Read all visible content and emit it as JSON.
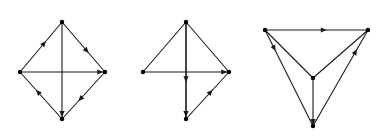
{
  "figure": {
    "type": "diagram",
    "edge_color": "#1a1a1a",
    "vertex_color": "#000000",
    "background": "#ffffff"
  },
  "operators": [
    {
      "id": "op1",
      "symbol": "=",
      "x": 117,
      "y": 73
    },
    {
      "id": "op2",
      "symbol": "=",
      "x": 241,
      "y": 73
    }
  ],
  "diagrams": [
    {
      "id": "diagram-1",
      "shape": "diamond",
      "vertices": [
        {
          "id": "top",
          "cx": 62,
          "cy": 22,
          "sign": "+",
          "sign_x": 62,
          "sign_y": 13
        },
        {
          "id": "left",
          "cx": 20,
          "cy": 72,
          "sign": "+",
          "sign_x": 9,
          "sign_y": 76
        },
        {
          "id": "right",
          "cx": 105,
          "cy": 72,
          "sign": "+",
          "sign_x": 110,
          "sign_y": 79
        },
        {
          "id": "bottom",
          "cx": 62,
          "cy": 119,
          "sign": "+",
          "sign_x": 62,
          "sign_y": 134
        }
      ],
      "edges": [
        {
          "id": "d",
          "label": "d",
          "from": "left",
          "to": "top",
          "label_x": 32,
          "label_y": 43,
          "arrow": "toward-to",
          "arrow_t": 0.62
        },
        {
          "id": "b",
          "label": "b",
          "from": "top",
          "to": "right",
          "label_x": 88,
          "label_y": 43,
          "arrow": "toward-to",
          "arrow_t": 0.62
        },
        {
          "id": "c",
          "label": "c",
          "from": "bottom",
          "to": "left",
          "label_x": 32,
          "label_y": 101,
          "arrow": "toward-to",
          "arrow_t": 0.62
        },
        {
          "id": "a",
          "label": "a",
          "from": "right",
          "to": "bottom",
          "label_x": 88,
          "label_y": 101,
          "arrow": "toward-to",
          "arrow_t": 0.62
        },
        {
          "id": "e",
          "label": "e",
          "from": "left",
          "to": "right",
          "label_x": 90,
          "label_y": 68,
          "arrow": "toward-to",
          "arrow_t": 0.98
        },
        {
          "id": "f",
          "label": "f",
          "from": "top",
          "to": "bottom",
          "label_x": 56,
          "label_y": 98,
          "arrow": "toward-to",
          "arrow_t": 0.98
        }
      ]
    },
    {
      "id": "diagram-2",
      "shape": "diamond",
      "vertices": [
        {
          "id": "top",
          "cx": 186,
          "cy": 22,
          "sign": "+",
          "sign_x": 186,
          "sign_y": 13
        },
        {
          "id": "left",
          "cx": 143,
          "cy": 72,
          "sign": "+",
          "sign_x": 133,
          "sign_y": 79
        },
        {
          "id": "right",
          "cx": 229,
          "cy": 72,
          "sign": "+",
          "sign_x": 234,
          "sign_y": 79
        },
        {
          "id": "bottom",
          "cx": 186,
          "cy": 119,
          "sign": "+",
          "sign_x": 186,
          "sign_y": 134
        }
      ],
      "edges": [
        {
          "id": "d",
          "label": "d",
          "from": "left",
          "to": "top",
          "label_x": 155,
          "label_y": 43,
          "arrow": "none",
          "arrow_t": 0.62
        },
        {
          "id": "b",
          "label": "b",
          "from": "top",
          "to": "right",
          "label_x": 211,
          "label_y": 43,
          "arrow": "none",
          "arrow_t": 0.62
        },
        {
          "id": "c",
          "label": "c",
          "from": "top",
          "to": "bottom",
          "label_x": 155,
          "label_y": 101,
          "arrow": "toward-to",
          "arrow_t": 0.62
        },
        {
          "id": "a",
          "label": "a",
          "from": "bottom",
          "to": "right",
          "label_x": 211,
          "label_y": 101,
          "arrow": "toward-to",
          "arrow_t": 0.62
        },
        {
          "id": "e",
          "label": "e",
          "from": "left",
          "to": "right",
          "label_x": 213,
          "label_y": 68,
          "arrow": "toward-to",
          "arrow_t": 0.98
        },
        {
          "id": "f",
          "label": "f",
          "from": "top",
          "to": "bottom",
          "label_x": 180,
          "label_y": 57,
          "arrow": "toward-to",
          "arrow_t": 0.98
        }
      ]
    },
    {
      "id": "diagram-3",
      "shape": "triangle-with-center",
      "vertices": [
        {
          "id": "topleft",
          "cx": 265,
          "cy": 30,
          "sign": "−",
          "sign_x": 261,
          "sign_y": 22
        },
        {
          "id": "topright",
          "cx": 368,
          "cy": 30,
          "sign": "−",
          "sign_x": 367,
          "sign_y": 22
        },
        {
          "id": "center",
          "cx": 313,
          "cy": 78,
          "sign": "+",
          "sign_x": 322,
          "sign_y": 80
        },
        {
          "id": "bottom",
          "cx": 313,
          "cy": 126,
          "sign": "+",
          "sign_x": 313,
          "sign_y": 137
        }
      ],
      "edges": [
        {
          "id": "e",
          "label": "e",
          "from": "topleft",
          "to": "topright",
          "label_x": 315,
          "label_y": 25,
          "arrow": "toward-to",
          "arrow_t": 0.6
        },
        {
          "id": "d",
          "label": "d",
          "from": "topleft",
          "to": "center",
          "label_x": 287,
          "label_y": 50,
          "arrow": "none",
          "arrow_t": 0.62
        },
        {
          "id": "b",
          "label": "b",
          "from": "topright",
          "to": "center",
          "label_x": 338,
          "label_y": 50,
          "arrow": "none",
          "arrow_t": 0.62
        },
        {
          "id": "c",
          "label": "c",
          "from": "topleft",
          "to": "bottom",
          "label_x": 282,
          "label_y": 82,
          "arrow": "toward-to",
          "arrow_t": 0.22
        },
        {
          "id": "a",
          "label": "a",
          "from": "bottom",
          "to": "topright",
          "label_x": 345,
          "label_y": 82,
          "arrow": "toward-to",
          "arrow_t": 0.8
        },
        {
          "id": "f",
          "label": "f",
          "from": "center",
          "to": "bottom",
          "label_x": 304,
          "label_y": 96,
          "arrow": "toward-to",
          "arrow_t": 0.98
        }
      ]
    }
  ]
}
